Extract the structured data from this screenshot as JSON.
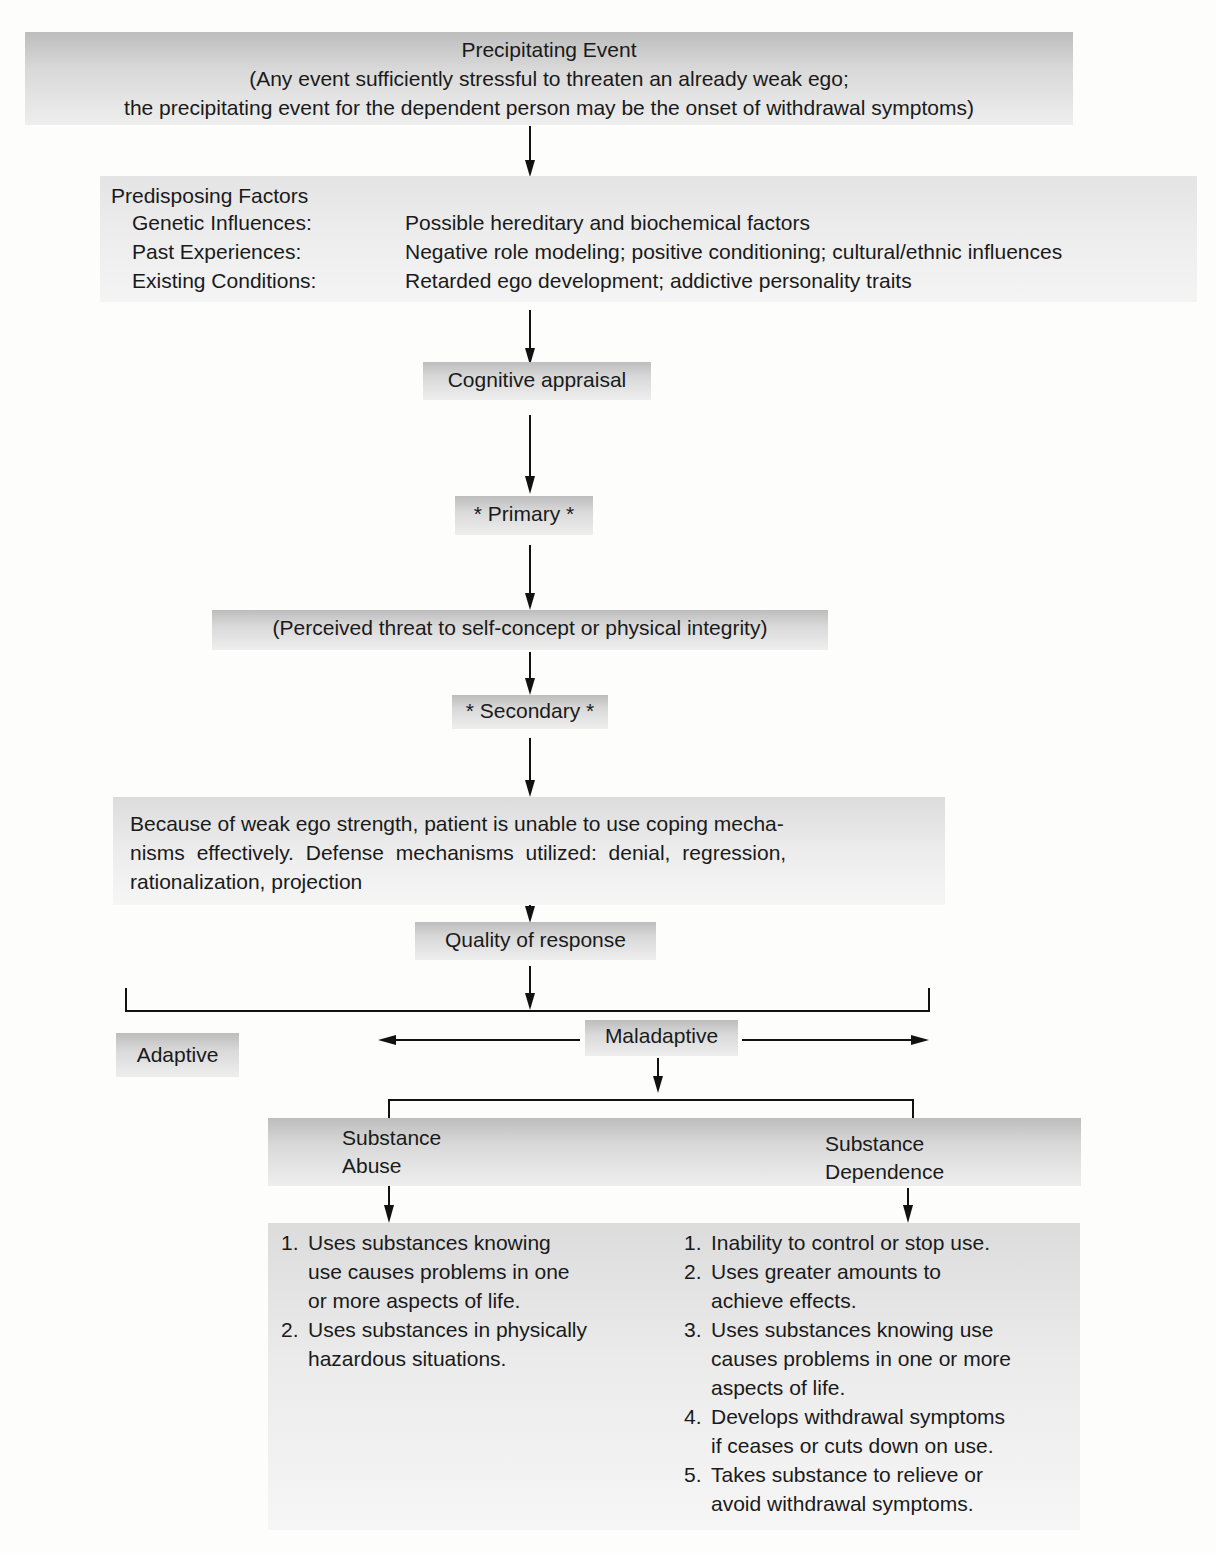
{
  "precipitating_event": {
    "title": "Precipitating Event",
    "line1": "(Any event sufficiently stressful to threaten an already weak ego;",
    "line2": "the precipitating event for the dependent person may be the onset of withdrawal symptoms)"
  },
  "predisposing_factors": {
    "title": "Predisposing Factors",
    "rows": [
      {
        "label": "Genetic Influences:",
        "value": "Possible hereditary and biochemical factors"
      },
      {
        "label": "Past Experiences:",
        "value": "Negative role modeling; positive conditioning; cultural/ethnic influences"
      },
      {
        "label": "Existing Conditions:",
        "value": "Retarded ego development; addictive personality traits"
      }
    ]
  },
  "cognitive_appraisal": "Cognitive appraisal",
  "primary": "* Primary *",
  "perceived_threat": "(Perceived threat to self-concept or physical integrity)",
  "secondary": "* Secondary *",
  "defense": {
    "text": "Because of weak ego strength, patient is unable to use coping mecha-nisms effectively. Defense mechanisms utilized: denial, regression, rationalization, projection",
    "line1": "Because of weak ego strength, patient is unable to use coping mecha-",
    "line2": "nisms effectively. Defense mechanisms utilized: denial, regression,",
    "line3": "rationalization, projection"
  },
  "quality_of_response": "Quality of response",
  "adaptive": "Adaptive",
  "maladaptive": "Maladaptive",
  "substance_abuse": {
    "title_line1": "Substance",
    "title_line2": "Abuse",
    "criteria": [
      {
        "num": "1.",
        "lines": [
          "Uses substances knowing",
          "use causes problems in one",
          "or more aspects of life."
        ]
      },
      {
        "num": "2.",
        "lines": [
          "Uses substances in physically",
          "hazardous situations."
        ]
      }
    ]
  },
  "substance_dependence": {
    "title_line1": "Substance",
    "title_line2": "Dependence",
    "criteria": [
      {
        "num": "1.",
        "lines": [
          "Inability to control or stop use."
        ]
      },
      {
        "num": "2.",
        "lines": [
          "Uses greater amounts to",
          "achieve effects."
        ]
      },
      {
        "num": "3.",
        "lines": [
          "Uses substances knowing use",
          "causes problems in one or more",
          "aspects of life."
        ]
      },
      {
        "num": "4.",
        "lines": [
          "Develops withdrawal symptoms",
          "if ceases or cuts down on use."
        ]
      },
      {
        "num": "5.",
        "lines": [
          "Takes substance to relieve or",
          "avoid withdrawal symptoms."
        ]
      }
    ]
  },
  "colors": {
    "box_dark": "#bdbdbd",
    "box_light": "#eeeeee",
    "line": "#111111",
    "text": "#1a1a1a"
  }
}
